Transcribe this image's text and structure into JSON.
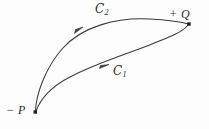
{
  "figure": {
    "type": "math-diagram",
    "background_color": "#fdfdfd",
    "ink_color": "#3a3a3a",
    "width": 209,
    "height": 129
  },
  "points": [
    {
      "id": "Q",
      "label": "+ Q",
      "sign": "+",
      "name": "Q",
      "x": 189,
      "y": 24,
      "marker": "filled-square-dot"
    },
    {
      "id": "P",
      "label": "− P",
      "sign": "−",
      "name": "P",
      "x": 35,
      "y": 112,
      "marker": "filled-square-dot"
    }
  ],
  "curves": [
    {
      "id": "C2",
      "label": "C",
      "subscript": "2",
      "from": "P",
      "to": "Q",
      "orientation": "from P to Q",
      "arrow_at": {
        "x": 79,
        "y": 29
      },
      "position": "upper"
    },
    {
      "id": "C1",
      "label": "C",
      "subscript": "1",
      "from": "P",
      "to": "Q",
      "orientation": "from P to Q",
      "arrow_at": {
        "x": 105,
        "y": 66
      },
      "position": "lower"
    }
  ]
}
